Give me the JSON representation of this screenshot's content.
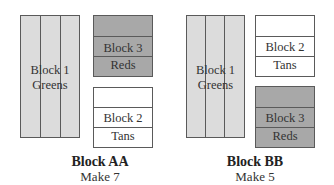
{
  "diagrams": [
    {
      "title": "Block AA",
      "subtitle": "Make 7",
      "blocks": [
        {
          "line1": "Block 1",
          "line2": "Greens",
          "shade": "greens"
        },
        {
          "line1": "Block 3",
          "line2": "Reds",
          "shade": "reds"
        },
        {
          "line1": "Block 2",
          "line2": "Tans",
          "shade": "tans"
        }
      ]
    },
    {
      "title": "Block BB",
      "subtitle": "Make 5",
      "blocks": [
        {
          "line1": "Block 1",
          "line2": "Greens",
          "shade": "greens"
        },
        {
          "line1": "Block 2",
          "line2": "Tans",
          "shade": "tans"
        },
        {
          "line1": "Block 3",
          "line2": "Reds",
          "shade": "reds"
        }
      ]
    }
  ],
  "colors": {
    "greens": "#dcdcdc",
    "reds": "#a8a8a8",
    "tans": "#ffffff",
    "border": "#5a5a5a"
  }
}
